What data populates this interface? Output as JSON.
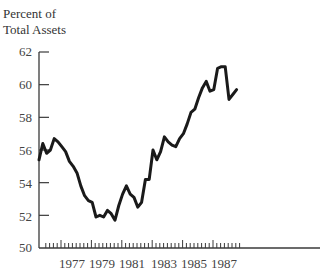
{
  "chart_data": {
    "type": "line",
    "title": "",
    "ylabel": "Percent of Total Assets",
    "ylabel_lines": [
      "Percent of",
      "Total Assets"
    ],
    "xlabel": "",
    "ylim": [
      50,
      62
    ],
    "y_ticks": [
      50,
      52,
      54,
      56,
      58,
      60,
      62
    ],
    "x_range": [
      1976,
      1989
    ],
    "x_tick_labels": [
      "1977",
      "1979",
      "1981",
      "1983",
      "1985",
      "1987"
    ],
    "x_minor_ticks": "quarterly",
    "grid": false,
    "legend": null,
    "series": [
      {
        "name": "Percent of Total Assets",
        "frequency": "quarterly",
        "x": [
          1975.75,
          1976.0,
          1976.25,
          1976.5,
          1976.75,
          1977.0,
          1977.25,
          1977.5,
          1977.75,
          1978.0,
          1978.25,
          1978.5,
          1978.75,
          1979.0,
          1979.25,
          1979.5,
          1979.75,
          1980.0,
          1980.25,
          1980.5,
          1980.75,
          1981.0,
          1981.25,
          1981.5,
          1981.75,
          1982.0,
          1982.25,
          1982.5,
          1982.75,
          1983.0,
          1983.25,
          1983.5,
          1983.75,
          1984.0,
          1984.25,
          1984.5,
          1984.75,
          1985.0,
          1985.25,
          1985.5,
          1985.75,
          1986.0,
          1986.25,
          1986.5,
          1986.75,
          1987.0,
          1987.25,
          1987.5,
          1987.75,
          1988.0,
          1988.25,
          1988.5,
          1988.75
        ],
        "values": [
          55.4,
          56.4,
          55.8,
          56.0,
          56.7,
          56.5,
          56.2,
          55.9,
          55.3,
          55.0,
          54.6,
          53.8,
          53.2,
          52.9,
          52.8,
          51.9,
          52.0,
          51.9,
          52.3,
          52.1,
          51.7,
          52.6,
          53.3,
          53.8,
          53.3,
          53.1,
          52.5,
          52.8,
          54.2,
          54.2,
          56.0,
          55.4,
          55.9,
          56.8,
          56.5,
          56.3,
          56.2,
          56.7,
          57.0,
          57.6,
          58.3,
          58.5,
          59.2,
          59.8,
          60.2,
          59.6,
          59.7,
          61.0,
          61.1,
          61.1,
          59.1,
          59.4,
          59.7
        ],
        "color": "#1a1a1a"
      }
    ]
  },
  "labels": {
    "ylabel_line1": "Percent of",
    "ylabel_line2": "Total Assets",
    "y62": "62",
    "y60": "60",
    "y58": "58",
    "y56": "56",
    "y54": "54",
    "y52": "52",
    "y50": "50",
    "x1977": "1977",
    "x1979": "1979",
    "x1981": "1981",
    "x1983": "1983",
    "x1985": "1985",
    "x1987": "1987"
  }
}
